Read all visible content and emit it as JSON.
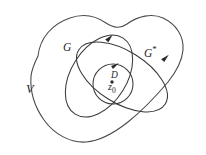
{
  "figure": {
    "kind": "set-diagram",
    "background_color": "#ffffff",
    "stroke_color": "#3a3a3a",
    "label_color": "#262626",
    "width": 206,
    "height": 155,
    "labels": {
      "outer_region": "V",
      "ellipse_left": "G",
      "ellipse_right_base": "G",
      "ellipse_right_star": "*",
      "inner_disk": "D",
      "point_base": "z",
      "point_subscript": "0"
    },
    "regions": [
      {
        "name": "V",
        "label": "V",
        "shape": "irregular-blob",
        "description": "outermost irregular closed region enclosing all others"
      },
      {
        "name": "G",
        "label": "G",
        "shape": "tilted-ellipse",
        "description": "ellipse tilted counterclockwise, left of center, with arrowhead at upper right"
      },
      {
        "name": "G-star",
        "label": "G*",
        "shape": "tilted-ellipse",
        "description": "elongated ellipse tilted clockwise, right of center, with arrowhead on right side"
      },
      {
        "name": "D",
        "label": "D",
        "shape": "circle",
        "description": "small inner circle with arrowhead at top, containing the point z0"
      }
    ],
    "point": {
      "name": "z0",
      "label": "z0",
      "inside_region": "D"
    },
    "orientation_arrows": [
      {
        "on": "G",
        "direction": "counterclockwise"
      },
      {
        "on": "G-star",
        "direction": "counterclockwise"
      },
      {
        "on": "D",
        "direction": "counterclockwise"
      }
    ]
  }
}
